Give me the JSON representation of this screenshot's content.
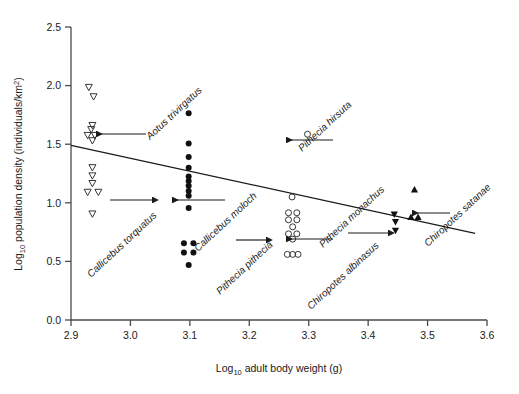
{
  "chart_data": {
    "type": "scatter",
    "title": "",
    "xlabel": "Log10 adult body weight (g)",
    "xlabel_main": "Log",
    "xlabel_sub": "10",
    "xlabel_rest": " adult body weight (g)",
    "ylabel": "Log10 population density (individuals/km2)",
    "ylabel_main": "Log",
    "ylabel_sub": "10",
    "ylabel_rest": " population density (individuals/km",
    "ylabel_sup": "2",
    "ylabel_end": ")",
    "xlim": [
      2.9,
      3.6
    ],
    "ylim": [
      0.0,
      2.5
    ],
    "xticks": [
      "2.9",
      "3.0",
      "3.1",
      "3.2",
      "3.3",
      "3.4",
      "3.5",
      "3.6"
    ],
    "xtick_values": [
      2.9,
      3.0,
      3.1,
      3.2,
      3.3,
      3.4,
      3.5,
      3.6
    ],
    "yticks": [
      "0.0",
      "0.5",
      "1.0",
      "1.5",
      "2.0",
      "2.5"
    ],
    "ytick_values": [
      0.0,
      0.5,
      1.0,
      1.5,
      2.0,
      2.5
    ],
    "grid": false,
    "legend": "none",
    "trendline": {
      "label": "regression line",
      "x_start": 2.9,
      "y_start": 1.49,
      "x_end": 3.58,
      "y_end": 0.74
    },
    "series": [
      {
        "name": "Aotus trivirgatus",
        "marker": "open-triangle-down",
        "points": [
          [
            2.93,
            1.985
          ],
          [
            2.938,
            1.905
          ],
          [
            2.936,
            1.66
          ],
          [
            2.934,
            1.625
          ],
          [
            2.928,
            1.575
          ],
          [
            2.94,
            1.575
          ],
          [
            2.936,
            1.53
          ],
          [
            2.936,
            1.3
          ],
          [
            2.936,
            1.23
          ],
          [
            2.936,
            1.165
          ],
          [
            2.928,
            1.09
          ],
          [
            2.946,
            1.09
          ],
          [
            2.936,
            0.905
          ]
        ]
      },
      {
        "name": "Callicebus torquatus",
        "marker": "filled-circle",
        "points": [
          [
            3.098,
            1.765
          ],
          [
            3.098,
            1.505
          ],
          [
            3.098,
            1.39
          ],
          [
            3.098,
            1.3
          ],
          [
            3.098,
            1.225
          ],
          [
            3.098,
            1.185
          ],
          [
            3.098,
            1.145
          ],
          [
            3.098,
            1.1
          ],
          [
            3.098,
            1.06
          ],
          [
            3.098,
            0.955
          ],
          [
            3.09,
            0.655
          ],
          [
            3.106,
            0.655
          ],
          [
            3.09,
            0.575
          ],
          [
            3.106,
            0.575
          ],
          [
            3.098,
            0.47
          ]
        ]
      },
      {
        "name": "Callicebus moloch",
        "marker": "filled-circle",
        "points": []
      },
      {
        "name": "Pithecia hirsuta",
        "marker": "open-circle",
        "points": [
          [
            3.298,
            1.585
          ]
        ]
      },
      {
        "name": "Pithecia monachus",
        "marker": "open-circle",
        "points": [
          [
            3.272,
            1.05
          ]
        ]
      },
      {
        "name": "Pithecia pithecia",
        "marker": "open-circle",
        "points": [
          [
            3.266,
            0.915
          ],
          [
            3.28,
            0.915
          ],
          [
            3.266,
            0.855
          ],
          [
            3.28,
            0.855
          ],
          [
            3.273,
            0.795
          ],
          [
            3.266,
            0.735
          ],
          [
            3.28,
            0.735
          ],
          [
            3.273,
            0.69
          ],
          [
            3.264,
            0.56
          ],
          [
            3.273,
            0.56
          ],
          [
            3.282,
            0.56
          ]
        ]
      },
      {
        "name": "Chiropotes satanae",
        "marker": "filled-triangle-up",
        "points": [
          [
            3.478,
            1.115
          ],
          [
            3.472,
            0.88
          ],
          [
            3.484,
            0.88
          ]
        ]
      },
      {
        "name": "Chiropotes albinasus",
        "marker": "filled-triangle-down",
        "points": [
          [
            3.444,
            0.9
          ],
          [
            3.446,
            0.835
          ],
          [
            3.446,
            0.76
          ]
        ]
      }
    ],
    "annotations": [
      {
        "id": "aotus-trivirgatus",
        "text": "Aotus trivirgatus",
        "label_x": 150,
        "label_y": 140,
        "rotation": -43,
        "leader": {
          "x1": 146,
          "y1": 134,
          "x2": 96,
          "y2": 134,
          "arrow": "left"
        }
      },
      {
        "id": "callicebus-torquatus",
        "text": "Callicebus torquatus",
        "label_x": 91,
        "label_y": 278,
        "rotation": -43,
        "leader": {
          "x1": 110,
          "y1": 200,
          "x2": 152,
          "y2": 200,
          "arrow": "right"
        }
      },
      {
        "id": "callicebus-moloch",
        "text": "Callicebus moloch",
        "label_x": 198,
        "label_y": 252,
        "rotation": -43,
        "leader": {
          "x1": 225,
          "y1": 200,
          "x2": 172,
          "y2": 200,
          "arrow": "left"
        }
      },
      {
        "id": "pithecia-hirsuta",
        "text": "Pithecia hirsuta",
        "label_x": 302,
        "label_y": 152,
        "rotation": -43,
        "leader": {
          "x1": 333,
          "y1": 140,
          "x2": 286,
          "y2": 140,
          "arrow": "left"
        }
      },
      {
        "id": "pithecia-monachus",
        "text": "Pithecia monachus",
        "label_x": 323,
        "label_y": 248,
        "rotation": -43,
        "leader": {
          "x1": 333,
          "y1": 239,
          "x2": 286,
          "y2": 239,
          "arrow": "left"
        }
      },
      {
        "id": "pithecia-pithecia",
        "text": "Pithecia pithecia",
        "label_x": 220,
        "label_y": 295,
        "rotation": -43,
        "leader": {
          "x1": 236,
          "y1": 240,
          "x2": 266,
          "y2": 240,
          "arrow": "right"
        }
      },
      {
        "id": "chiropotes-albinasus",
        "text": "Chiropotes albinasus",
        "label_x": 311,
        "label_y": 310,
        "rotation": -43,
        "leader": {
          "x1": 348,
          "y1": 233,
          "x2": 388,
          "y2": 233,
          "arrow": "right"
        }
      },
      {
        "id": "chiropotes-satanae",
        "text": "Chiropotes satanae",
        "label_x": 428,
        "label_y": 247,
        "rotation": -43,
        "leader": {
          "x1": 450,
          "y1": 213,
          "x2": 412,
          "y2": 213,
          "arrow": "left"
        }
      }
    ]
  }
}
